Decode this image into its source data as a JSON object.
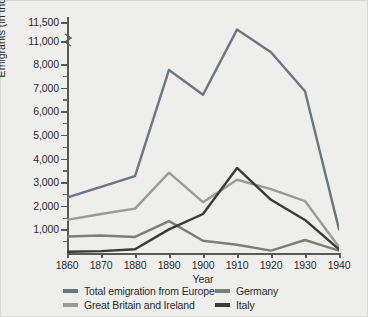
{
  "chart_data": {
    "type": "line",
    "title": "",
    "xlabel": "Year",
    "ylabel": "Emigrants (in thousands)",
    "x": [
      1860,
      1870,
      1880,
      1890,
      1900,
      1910,
      1920,
      1930,
      1940
    ],
    "xtick_labels": [
      "1860",
      "1870",
      "1880",
      "1890",
      "1900",
      "1910",
      "1920",
      "1930",
      "1940"
    ],
    "ytick_labels": [
      "1,000",
      "2,000",
      "3,000",
      "4,000",
      "5,000",
      "6,000",
      "7,000",
      "8,000",
      "11,000",
      "11,500"
    ],
    "ytick_values": [
      1000,
      2000,
      3000,
      4000,
      5000,
      6000,
      7000,
      8000,
      11000,
      11500
    ],
    "ylim": [
      0,
      11500
    ],
    "xlim": [
      1860,
      1940
    ],
    "axis_break": {
      "between": [
        8000,
        11000
      ],
      "marker": "zigzag"
    },
    "minor_ticks": true,
    "grid": false,
    "legend_position": "below-axes",
    "series": [
      {
        "name": "Total emigration from Europe",
        "color": "#6d7580",
        "values": [
          2350,
          2800,
          3250,
          7750,
          6700,
          11300,
          8500,
          6850,
          1000
        ]
      },
      {
        "name": "Great Britain and Ireland",
        "color": "#9a9a9a",
        "values": [
          1400,
          1650,
          1880,
          3400,
          2150,
          3100,
          2700,
          2200,
          250
        ]
      },
      {
        "name": "Germany",
        "color": "#7d7d7d",
        "values": [
          700,
          740,
          680,
          1350,
          520,
          350,
          100,
          550,
          100
        ]
      },
      {
        "name": "Italy",
        "color": "#3a3a3a",
        "values": [
          50,
          80,
          160,
          1000,
          1650,
          3600,
          2250,
          1400,
          150
        ]
      }
    ]
  },
  "legend": {
    "items": [
      {
        "label": "Total emigration from Europe",
        "color": "#6d7580"
      },
      {
        "label": "Germany",
        "color": "#7d7d7d"
      },
      {
        "label": "Great Britain and Ireland",
        "color": "#9a9a9a"
      },
      {
        "label": "Italy",
        "color": "#3a3a3a"
      }
    ]
  }
}
